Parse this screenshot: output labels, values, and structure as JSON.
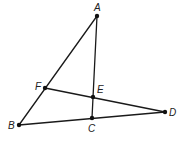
{
  "diagram": {
    "type": "geometry",
    "points": [
      {
        "name": "A",
        "x": 97,
        "y": 16,
        "label_x": 94,
        "label_y": 11
      },
      {
        "name": "B",
        "x": 19,
        "y": 125,
        "label_x": 8,
        "label_y": 129
      },
      {
        "name": "C",
        "x": 92,
        "y": 118,
        "label_x": 88,
        "label_y": 132
      },
      {
        "name": "D",
        "x": 165,
        "y": 112,
        "label_x": 169,
        "label_y": 116
      },
      {
        "name": "E",
        "x": 93,
        "y": 97,
        "label_x": 97,
        "label_y": 93
      },
      {
        "name": "F",
        "x": 45,
        "y": 88,
        "label_x": 35,
        "label_y": 90
      }
    ],
    "segments": [
      {
        "from": "A",
        "to": "B"
      },
      {
        "from": "A",
        "to": "C"
      },
      {
        "from": "B",
        "to": "D"
      },
      {
        "from": "F",
        "to": "D"
      }
    ]
  }
}
